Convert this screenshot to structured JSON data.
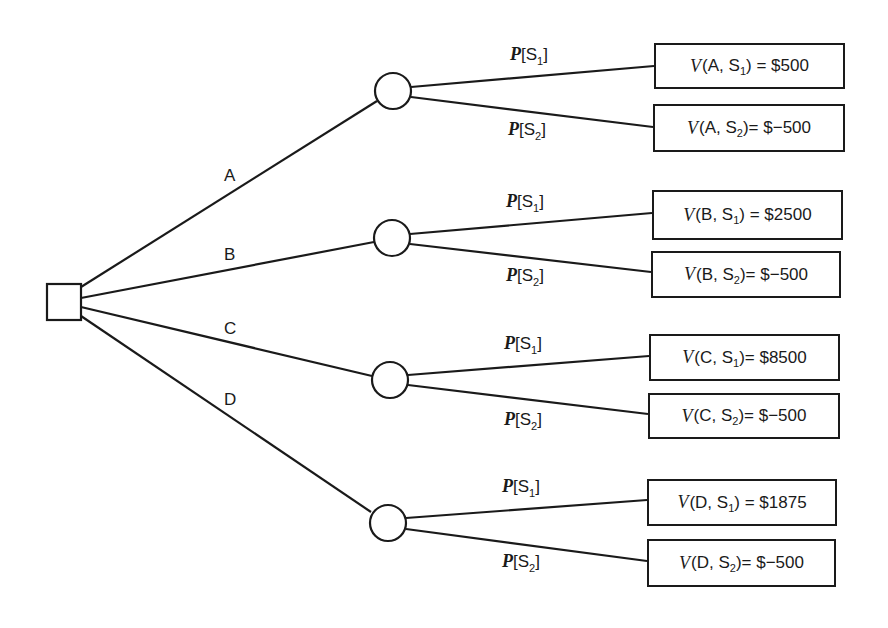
{
  "diagram": {
    "type": "decision-tree",
    "decision_node": {
      "shape": "square"
    },
    "alternatives": [
      {
        "label": "A",
        "outcomes": [
          {
            "prob_label": "P",
            "state": "S",
            "state_sub": "1",
            "value_prefix": "V",
            "alt": "A",
            "eq": " = ",
            "value": "$500"
          },
          {
            "prob_label": "P",
            "state": "S",
            "state_sub": "2",
            "value_prefix": "V",
            "alt": "A",
            "eq": "= ",
            "value": "$−500"
          }
        ]
      },
      {
        "label": "B",
        "outcomes": [
          {
            "prob_label": "P",
            "state": "S",
            "state_sub": "1",
            "value_prefix": "V",
            "alt": "B",
            "eq": " = ",
            "value": "$2500"
          },
          {
            "prob_label": "P",
            "state": "S",
            "state_sub": "2",
            "value_prefix": "V",
            "alt": "B",
            "eq": "= ",
            "value": "$−500"
          }
        ]
      },
      {
        "label": "C",
        "outcomes": [
          {
            "prob_label": "P",
            "state": "S",
            "state_sub": "1",
            "value_prefix": "V",
            "alt": "C",
            "eq": "= ",
            "value": "$8500"
          },
          {
            "prob_label": "P",
            "state": "S",
            "state_sub": "2",
            "value_prefix": "V",
            "alt": "C",
            "eq": "= ",
            "value": "$−500"
          }
        ]
      },
      {
        "label": "D",
        "outcomes": [
          {
            "prob_label": "P",
            "state": "S",
            "state_sub": "1",
            "value_prefix": "V",
            "alt": "D",
            "eq": " = ",
            "value": "$1875"
          },
          {
            "prob_label": "P",
            "state": "S",
            "state_sub": "2",
            "value_prefix": "V",
            "alt": "D",
            "eq": "= ",
            "value": "$−500"
          }
        ]
      }
    ]
  }
}
